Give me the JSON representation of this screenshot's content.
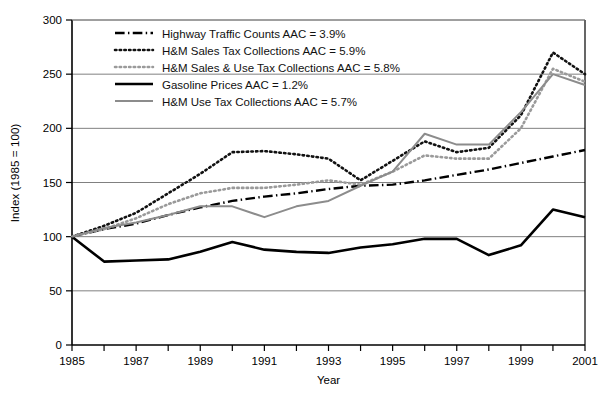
{
  "chart_data": {
    "type": "line",
    "title": "",
    "xlabel": "Year",
    "ylabel": "Index (1985 = 100)",
    "xlim": [
      1985,
      2001
    ],
    "ylim": [
      0,
      300
    ],
    "yticks": [
      0,
      50,
      100,
      150,
      200,
      250,
      300
    ],
    "ytick_labels": [
      "0",
      "50",
      "100",
      "150",
      "200",
      "250",
      "300"
    ],
    "x": [
      1985,
      1986,
      1987,
      1988,
      1989,
      1990,
      1991,
      1992,
      1993,
      1994,
      1995,
      1996,
      1997,
      1998,
      1999,
      2000,
      2001
    ],
    "xtick_labels": [
      "1985",
      "",
      "1987",
      "",
      "1989",
      "",
      "1991",
      "",
      "1993",
      "",
      "1995",
      "",
      "1997",
      "",
      "1999",
      "",
      "2001"
    ],
    "grid": "horizontal",
    "legend_position": "upper-left",
    "series": [
      {
        "name": "Highway Traffic Counts AAC = 3.9%",
        "style": "dash-dot",
        "color": "#000000",
        "width": 2.4,
        "values": [
          100,
          107,
          112,
          120,
          127,
          133,
          137,
          140,
          144,
          147,
          148,
          152,
          157,
          162,
          168,
          174,
          180
        ]
      },
      {
        "name": "H&M Sales Tax Collections AAC = 5.9%",
        "style": "dotted",
        "color": "#111111",
        "width": 2.6,
        "values": [
          100,
          110,
          122,
          140,
          158,
          178,
          179,
          176,
          172,
          152,
          170,
          188,
          178,
          182,
          212,
          270,
          250
        ]
      },
      {
        "name": "H&M Sales & Use Tax Collections AAC = 5.8%",
        "style": "dotted",
        "color": "#9a9a9a",
        "width": 2.6,
        "values": [
          100,
          107,
          117,
          130,
          140,
          145,
          145,
          148,
          152,
          148,
          160,
          175,
          172,
          172,
          200,
          255,
          243
        ]
      },
      {
        "name": "Gasoline Prices AAC = 1.2%",
        "style": "solid",
        "color": "#000000",
        "width": 2.6,
        "values": [
          100,
          77,
          78,
          79,
          86,
          95,
          88,
          86,
          85,
          90,
          93,
          98,
          98,
          83,
          92,
          125,
          118
        ]
      },
      {
        "name": "H&M Use Tax Collections AAC = 5.7%",
        "style": "solid",
        "color": "#8c8c8c",
        "width": 2.0,
        "values": [
          100,
          108,
          113,
          120,
          128,
          128,
          118,
          128,
          133,
          147,
          160,
          195,
          185,
          185,
          215,
          250,
          240
        ]
      }
    ]
  },
  "legend": {
    "items": [
      {
        "label": "Highway Traffic Counts AAC = 3.9%"
      },
      {
        "label": "H&M Sales Tax Collections AAC = 5.9%"
      },
      {
        "label": "H&M Sales & Use Tax Collections AAC = 5.8%"
      },
      {
        "label": "Gasoline Prices AAC = 1.2%"
      },
      {
        "label": "H&M Use Tax Collections AAC = 5.7%"
      }
    ]
  },
  "colors": {
    "axis": "#000000",
    "grid": "#808080",
    "background": "#ffffff"
  }
}
